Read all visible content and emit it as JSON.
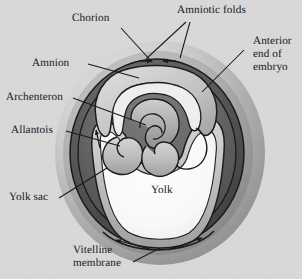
{
  "figure": {
    "background_color": "#d9d9d9",
    "text_color": "#17171c"
  },
  "labels": {
    "chorion": "Chorion",
    "amnion": "Amnion",
    "archenteron": "Archenteron",
    "allantois": "Allantois",
    "yolk_sac": "Yolk sac",
    "amniotic_folds": "Amniotic folds",
    "anterior_end_l1": "Anterior",
    "anterior_end_l2": "end of",
    "anterior_end_l3": "embryo",
    "yolk": "Yolk",
    "vitelline_l1": "Vitelline",
    "vitelline_l2": "membrane"
  },
  "colors": {
    "background": "#d9d9d9",
    "shell_outer": "#bdbdbd",
    "shell_mid": "#8d8d8d",
    "chorion_dark": "#4c4c4c",
    "cavity_dark": "#5a5a5a",
    "membrane_light": "#c9c9c9",
    "yolk_white": "#fdfdfd",
    "line": "#1a1a1a",
    "embryo_mid": "#9a9a9a"
  }
}
